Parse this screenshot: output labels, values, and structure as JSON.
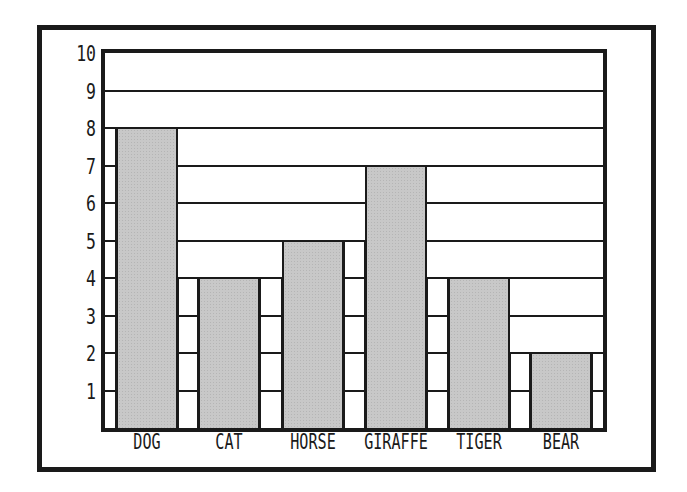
{
  "chart_data": {
    "type": "bar",
    "title": "",
    "xlabel": "",
    "ylabel": "",
    "categories": [
      "DOG",
      "CAT",
      "HORSE",
      "GIRAFFE",
      "TIGER",
      "BEAR"
    ],
    "values": [
      8,
      4,
      5,
      7,
      4,
      2
    ],
    "ylim": [
      0,
      10
    ],
    "yticks": [
      1,
      2,
      3,
      4,
      5,
      6,
      7,
      8,
      9,
      10
    ],
    "grid": true,
    "legend": null,
    "colors": {
      "bar_fill": "#c8c8c8",
      "outline": "#1a1a1a",
      "background": "#ffffff"
    }
  },
  "yaxis": {
    "labels": [
      "1",
      "2",
      "3",
      "4",
      "5",
      "6",
      "7",
      "8",
      "9",
      "10"
    ]
  },
  "xaxis": {
    "labels": [
      "DOG",
      "CAT",
      "HORSE",
      "GIRAFFE",
      "TIGER",
      "BEAR"
    ]
  }
}
